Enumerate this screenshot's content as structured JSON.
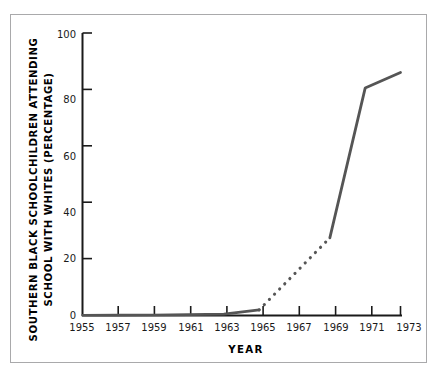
{
  "chart_data": {
    "type": "line",
    "title": "",
    "xlabel": "YEAR",
    "ylabel": "SOUTHERN BLACK SCHOOLCHILDREN ATTENDING SCHOOL WITH WHITES (PERCENTAGE)",
    "ylabel_lines": [
      "SOUTHERN BLACK SCHOOLCHILDREN ATTENDING",
      "SCHOOL WITH WHITES (PERCENTAGE)"
    ],
    "xlim": [
      1955,
      1973
    ],
    "ylim": [
      0,
      100
    ],
    "grid": false,
    "legend": null,
    "x_ticks": [
      1955,
      1957,
      1959,
      1961,
      1963,
      1965,
      1967,
      1969,
      1971,
      1973
    ],
    "x_tick_labels": [
      "1955",
      "1957",
      "1959",
      "1961",
      "1963",
      "1965",
      "1967",
      "1969",
      "1971",
      "1973"
    ],
    "y_ticks": [
      0,
      20,
      40,
      60,
      80,
      100
    ],
    "y_tick_labels": [
      "0",
      "20",
      "40",
      "60",
      "80",
      "100"
    ],
    "line_color": "#555555",
    "axis_color": "#1a1a1a",
    "frame_color": "#a9a9ab",
    "series": [
      {
        "name": "Southern black schoolchildren attending school with whites",
        "style": "solid",
        "x": [
          1955,
          1957,
          1959,
          1961,
          1963,
          1965
        ],
        "values": [
          0.1,
          0.15,
          0.2,
          0.3,
          0.5,
          2.0
        ]
      },
      {
        "name": "Interpolated (estimated) segment",
        "style": "dotted",
        "x": [
          1965,
          1969
        ],
        "values": [
          2.0,
          27.5
        ]
      },
      {
        "name": "Southern black schoolchildren attending school with whites (continued)",
        "style": "solid",
        "x": [
          1969,
          1971,
          1973
        ],
        "values": [
          27.5,
          80.5,
          86.0
        ]
      }
    ]
  }
}
